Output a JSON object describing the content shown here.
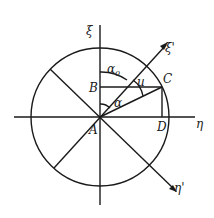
{
  "diagram": {
    "type": "geometric construction",
    "colors": {
      "ink": "#1a1a1a",
      "background": "#ffffff"
    },
    "axes": {
      "vertical": "ξ",
      "horizontal": "η",
      "rotated_vertical": "ξ'",
      "rotated_horizontal": "η'"
    },
    "points": {
      "A": "A",
      "B": "B",
      "C": "C",
      "D": "D"
    },
    "angles": {
      "alpha0": "α",
      "alpha0_sub": "0",
      "alpha": "α",
      "u": "u"
    }
  }
}
